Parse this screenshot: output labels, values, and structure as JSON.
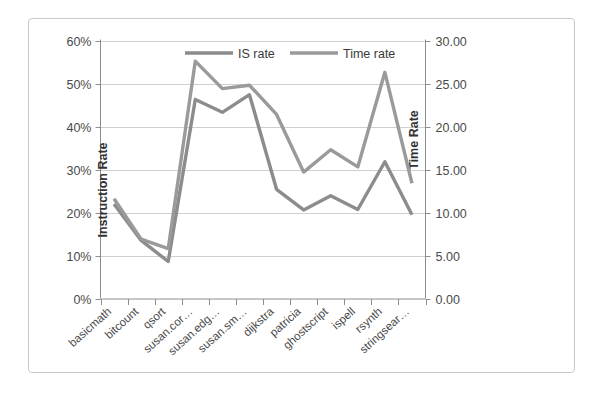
{
  "chart_data": {
    "type": "line",
    "title": "",
    "subtitle": "",
    "xlabel": "",
    "ylabel": "Instruction Rate",
    "y2label": "Time Rate",
    "grid": true,
    "legend_position": "top-center",
    "categories": [
      "basicmath",
      "bitcount",
      "qsort",
      "susan.cor…",
      "susan.edg…",
      "susan.sm…",
      "dijkstra",
      "patricia",
      "ghostscript",
      "ispell",
      "rsynth",
      "stringsear…"
    ],
    "ylim": [
      0,
      60
    ],
    "yticks": [
      0,
      10,
      20,
      30,
      40,
      50,
      60
    ],
    "ytick_labels": [
      "0%",
      "10%",
      "20%",
      "30%",
      "40%",
      "50%",
      "60%"
    ],
    "y2lim": [
      0,
      30
    ],
    "y2ticks": [
      0,
      5,
      10,
      15,
      20,
      25,
      30
    ],
    "y2tick_labels": [
      "0.00",
      "5.00",
      "10.00",
      "15.00",
      "20.00",
      "25.00",
      "30.00"
    ],
    "series": [
      {
        "name": "IS rate",
        "axis": "left",
        "unit": "%",
        "color": "#8c8c8c",
        "values": [
          22.0,
          13.5,
          8.6,
          46.3,
          43.3,
          47.4,
          25.4,
          20.6,
          23.9,
          20.7,
          31.8,
          19.5
        ]
      },
      {
        "name": "Time rate",
        "axis": "right",
        "unit": "",
        "color": "#9a9a9a",
        "values": [
          11.6,
          6.9,
          5.8,
          27.6,
          24.4,
          24.8,
          21.4,
          14.7,
          17.3,
          15.3,
          26.3,
          13.4
        ]
      }
    ],
    "legend": [
      "IS rate",
      "Time rate"
    ]
  },
  "colors": {
    "frame_border": "#c9c9c9",
    "gridline": "#c3c3c3",
    "axis": "#8d8d8d",
    "is_rate": "#8c8c8c",
    "time_rate": "#9a9a9a",
    "text": "#4a4a4a",
    "background": "#ffffff"
  }
}
